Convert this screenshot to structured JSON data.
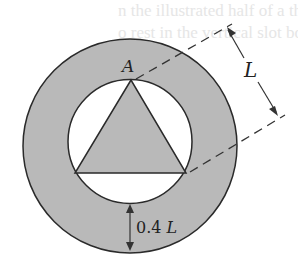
{
  "figure": {
    "kind": "geometry-diagram",
    "labels": {
      "vertex": "A",
      "side_length": "L",
      "ring_thickness": "0.4 L"
    },
    "bleed_through_text": [
      "n the illustrated half of a thi",
      "o rest in the vertical slot both"
    ],
    "colors": {
      "fill_gray": "#b9b9b9",
      "stroke": "#2a2a2a",
      "background": "#ffffff",
      "dashed_line": "#333333"
    }
  }
}
